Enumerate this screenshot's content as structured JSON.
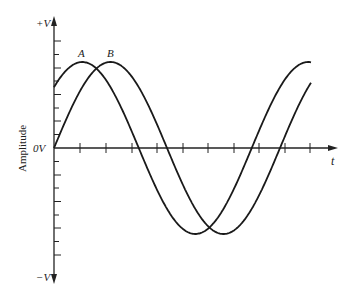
{
  "chart_data": {
    "type": "line",
    "title": "",
    "xlabel": "t",
    "ylabel": "Amplitude",
    "y_tick_labels": [
      "+V",
      "0V",
      "−V"
    ],
    "grid": false,
    "legend": "none (curves labeled inline)",
    "x_ticks_count": 11,
    "y_ticks_per_side": 8,
    "series": [
      {
        "name": "A",
        "description": "Sine wave leading B by ~45 degrees",
        "amplitude": 1.0,
        "phase_deg": 45,
        "label_at": "first peak"
      },
      {
        "name": "B",
        "description": "Sine wave starting at 0V",
        "amplitude": 1.0,
        "phase_deg": 0,
        "label_at": "first peak"
      }
    ],
    "annotations": [
      "A",
      "B"
    ],
    "ylim": [
      -1,
      1
    ],
    "period_approx_x_units": "about 1.0 cycle shown plus partial"
  },
  "axes": {
    "y_top_label": "+V",
    "y_zero_label": "0V",
    "y_bottom_label": "−V",
    "x_label": "t",
    "y_title": "Amplitude"
  },
  "curves": {
    "a_label": "A",
    "b_label": "B"
  }
}
